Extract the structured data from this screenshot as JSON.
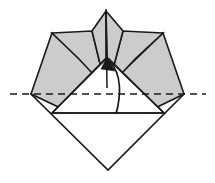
{
  "figure": {
    "canvas": {
      "width": 215,
      "height": 183
    },
    "colors": {
      "paper_front": "#ffffff",
      "paper_back": "#cccccc",
      "outline": "#1a1a1a",
      "background": "#ffffff",
      "arrow": "#1a1a1a",
      "axis": "#1a1a1a"
    },
    "shapes": {
      "base_diamond": {
        "name": "base-diamond",
        "fill": "#ffffff",
        "points": "31,94 108,18 184,94 108,170"
      },
      "left_lower_flap": {
        "name": "left-lower-gray-flap",
        "fill": "#cccccc",
        "points": "31,94 52,33 110,88 71,113"
      },
      "right_lower_flap": {
        "name": "right-lower-gray-flap",
        "fill": "#cccccc",
        "points": "184,94 163,33 106,88 145,113"
      },
      "left_upper_wing": {
        "name": "left-upper-gray-wing",
        "fill": "#cccccc",
        "points": "52,33 92,31 106,88 79,59"
      },
      "right_upper_wing": {
        "name": "right-upper-gray-wing",
        "fill": "#cccccc",
        "points": "163,33 123,31 108,88 135,59"
      },
      "center_left_petal": {
        "name": "center-left-gray-petal",
        "fill": "#cccccc",
        "points": "106,11 106,88 92,31"
      },
      "center_right_petal": {
        "name": "center-right-gray-petal",
        "fill": "#cccccc",
        "points": "106,11 108,88 123,31"
      }
    },
    "creases": [
      {
        "name": "triangle-left-edge",
        "d": "M 52,113 L 106,58"
      },
      {
        "name": "triangle-right-edge",
        "d": "M 164,113 L 108,58"
      },
      {
        "name": "triangle-base",
        "d": "M 52,113 L 164,113"
      },
      {
        "name": "center-vertical-crease",
        "d": "M 106,11 L 107,88"
      }
    ],
    "axis": {
      "name": "fold-axis-dashed-line",
      "x1": 10,
      "y1": 94,
      "x2": 206,
      "y2": 94,
      "dash": "7,5",
      "style": "dashed"
    },
    "arrow": {
      "name": "valley-fold-arrow",
      "direction": "upward",
      "path": "M 116,114 C 121,96 122,74 110,62",
      "head_points": "107,57 115,71 101,69",
      "tip": {
        "x": 107,
        "y": 57
      },
      "tail": {
        "x": 116,
        "y": 114
      }
    }
  }
}
